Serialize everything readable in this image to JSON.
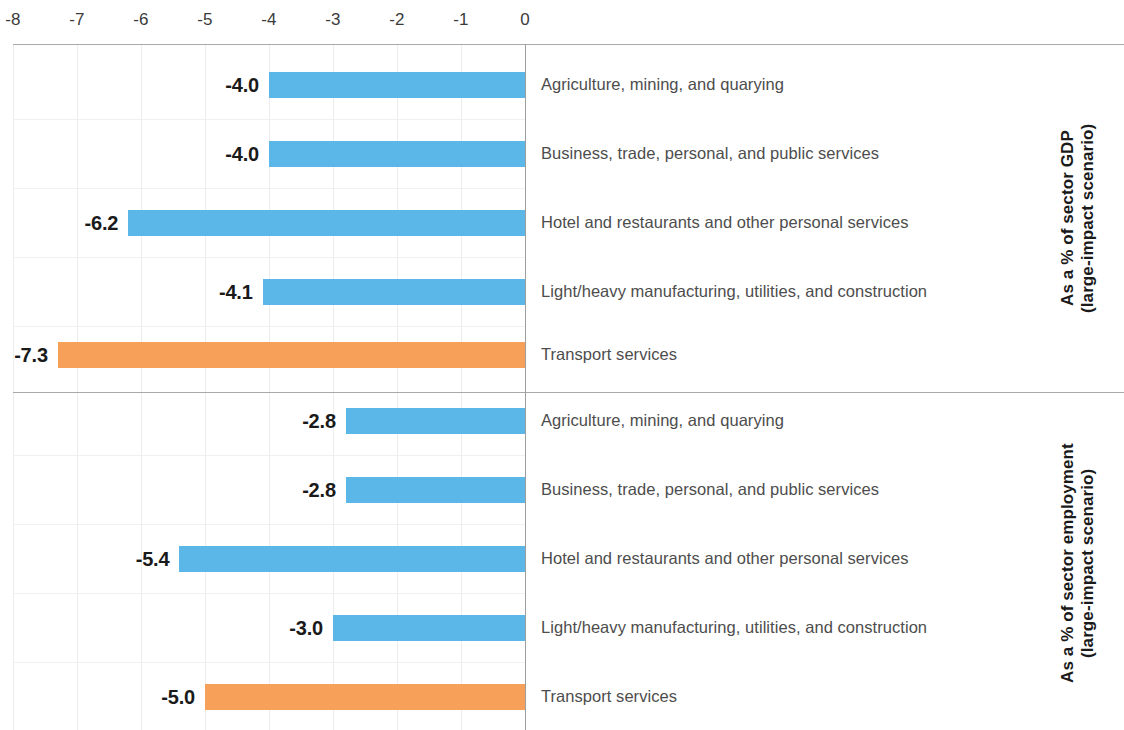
{
  "chart_data": {
    "type": "bar",
    "orientation": "horizontal",
    "title": "",
    "xlabel": "",
    "ylabel": "",
    "xlim": [
      -8,
      0
    ],
    "xticks": [
      "-8",
      "-7",
      "-6",
      "-5",
      "-4",
      "-3",
      "-2",
      "-1",
      "0"
    ],
    "xtick_values": [
      -8,
      -7,
      -6,
      -5,
      -4,
      -3,
      -2,
      -1,
      0
    ],
    "grid": true,
    "legend": "none",
    "colors": {
      "primary_bar": "#5BB7E8",
      "highlight_bar": "#F6A05A",
      "axis_line": "#9e9e9e",
      "gridline": "#ededed",
      "value_label": "#1a1a1a",
      "category_label": "#4d4d4d"
    },
    "panels": [
      {
        "axis_title": "As a % of sector GDP\n(large-impact scenario)",
        "categories": [
          "Agriculture, mining, and quarying",
          "Business, trade, personal, and public services",
          "Hotel and restaurants and other personal services",
          "Light/heavy manufacturing, utilities, and construction",
          "Transport services"
        ],
        "values": [
          -4.0,
          -4.0,
          -6.2,
          -4.1,
          -7.3
        ],
        "labels": [
          "-4.0",
          "-4.0",
          "-6.2",
          "-4.1",
          "-7.3"
        ],
        "bar_colors": [
          "#5BB7E8",
          "#5BB7E8",
          "#5BB7E8",
          "#5BB7E8",
          "#F6A05A"
        ]
      },
      {
        "axis_title": "As a % of sector employment\n(large-impact scenario)",
        "categories": [
          "Agriculture, mining, and quarying",
          "Business, trade, personal, and public services",
          "Hotel and restaurants and other personal services",
          "Light/heavy manufacturing, utilities, and construction",
          "Transport services"
        ],
        "values": [
          -2.8,
          -2.8,
          -5.4,
          -3.0,
          -5.0
        ],
        "labels": [
          "-2.8",
          "-2.8",
          "-5.4",
          "-3.0",
          "-5.0"
        ],
        "bar_colors": [
          "#5BB7E8",
          "#5BB7E8",
          "#5BB7E8",
          "#5BB7E8",
          "#F6A05A"
        ]
      }
    ]
  }
}
